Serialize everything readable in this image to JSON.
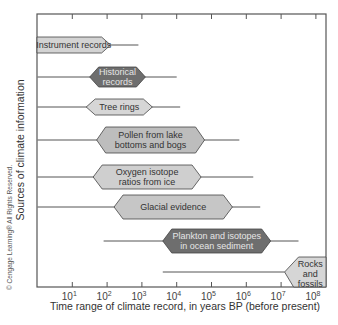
{
  "chart_data": {
    "type": "range-bar",
    "title": "",
    "xlabel": "Time range of climate record, in years BP (before present)",
    "ylabel": "Sources of climate information",
    "xscale": "log10",
    "xlim_exp": [
      0,
      8
    ],
    "x_ticks": [
      {
        "exp": 1,
        "label": "10",
        "sup": "1"
      },
      {
        "exp": 2,
        "label": "10",
        "sup": "2"
      },
      {
        "exp": 3,
        "label": "10",
        "sup": "3"
      },
      {
        "exp": 4,
        "label": "10",
        "sup": "4"
      },
      {
        "exp": 5,
        "label": "10",
        "sup": "5"
      },
      {
        "exp": 6,
        "label": "10",
        "sup": "6"
      },
      {
        "exp": 7,
        "label": "10",
        "sup": "7"
      },
      {
        "exp": 8,
        "label": "10",
        "sup": "8"
      }
    ],
    "grid": false,
    "series": [
      {
        "name": "Instrument records",
        "lines": [
          "Instrument records"
        ],
        "line_start_exp": 0,
        "line_end_exp": 2.9,
        "box_start_exp": 0,
        "box_end_exp": 2.1,
        "fill": "#d3d3d3",
        "tone": "light"
      },
      {
        "name": "Historical records",
        "lines": [
          "Historical",
          "records"
        ],
        "line_start_exp": 0,
        "line_end_exp": 4.0,
        "box_start_exp": 1.5,
        "box_end_exp": 3.1,
        "fill": "#6e6e6e",
        "tone": "dark"
      },
      {
        "name": "Tree rings",
        "lines": [
          "Tree rings"
        ],
        "line_start_exp": 0,
        "line_end_exp": 4.1,
        "box_start_exp": 1.4,
        "box_end_exp": 3.3,
        "fill": "#d6d6d6",
        "tone": "light"
      },
      {
        "name": "Pollen from lake bottoms and bogs",
        "lines": [
          "Pollen from lake",
          "bottoms and bogs"
        ],
        "line_start_exp": 0,
        "line_end_exp": 5.8,
        "box_start_exp": 1.7,
        "box_end_exp": 4.8,
        "fill": "#bdbdbd",
        "tone": "medium"
      },
      {
        "name": "Oxygen isotope ratios from ice",
        "lines": [
          "Oxygen isotope",
          "ratios from ice"
        ],
        "line_start_exp": 0,
        "line_end_exp": 6.2,
        "box_start_exp": 1.6,
        "box_end_exp": 4.7,
        "fill": "#cfcfcf",
        "tone": "light"
      },
      {
        "name": "Glacial evidence",
        "lines": [
          "Glacial evidence"
        ],
        "line_start_exp": 0,
        "line_end_exp": 6.4,
        "box_start_exp": 2.2,
        "box_end_exp": 5.6,
        "fill": "#c6c6c6",
        "tone": "medium-light"
      },
      {
        "name": "Plankton and isotopes in ocean sediment",
        "lines": [
          "Plankton and isotopes",
          "in ocean sediment"
        ],
        "line_start_exp": 1.9,
        "line_end_exp": 7.5,
        "box_start_exp": 3.6,
        "box_end_exp": 6.7,
        "fill": "#6e6e6e",
        "tone": "dark"
      },
      {
        "name": "Rocks and fossils",
        "lines": [
          "Rocks",
          "and",
          "fossils"
        ],
        "line_start_exp": 3.6,
        "line_end_exp": 7.1,
        "box_start_exp": 7.1,
        "box_end_exp": 8.3,
        "fill": "#d6d6d6",
        "tone": "light"
      }
    ],
    "credit": "© Cengage Learning® All Rights Reserved."
  },
  "colors": {
    "axis": "#555555",
    "line": "#555555",
    "dark_fill": "#6e6e6e",
    "light_fill": "#d4d4d4",
    "medium_fill": "#bdbdbd",
    "stroke": "#444444"
  }
}
